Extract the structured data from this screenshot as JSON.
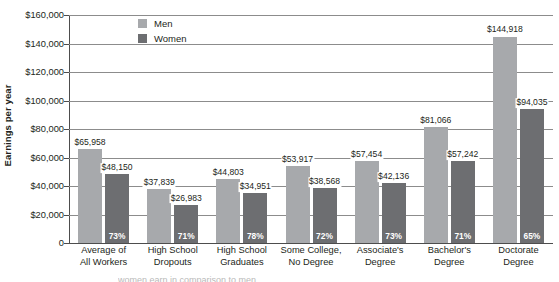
{
  "chart_data": {
    "type": "bar",
    "title": "",
    "xlabel": "",
    "ylabel": "Earnings per year",
    "ylim": [
      0,
      160000
    ],
    "grid": true,
    "legend_position": "top-center",
    "categories": [
      "Average of\nAll Workers",
      "High School\nDropouts",
      "High School\nGraduates",
      "Some College,\nNo Degree",
      "Associate's\nDegree",
      "Bachelor's\nDegree",
      "Doctorate\nDegree"
    ],
    "category_lines": [
      [
        "Average of",
        "All Workers"
      ],
      [
        "High School",
        "Dropouts"
      ],
      [
        "High School",
        "Graduates"
      ],
      [
        "Some College,",
        "No Degree"
      ],
      [
        "Associate's",
        "Degree"
      ],
      [
        "Bachelor's",
        "Degree"
      ],
      [
        "Doctorate",
        "Degree"
      ]
    ],
    "series": [
      {
        "name": "Men",
        "color": "#a7a9ac",
        "values": [
          65958,
          37839,
          44803,
          53917,
          57454,
          81066,
          144918
        ],
        "labels": [
          "$65,958",
          "$37,839",
          "$44,803",
          "$53,917",
          "$57,454",
          "$81,066",
          "$144,918"
        ]
      },
      {
        "name": "Women",
        "color": "#6d6e71",
        "values": [
          48150,
          26983,
          34951,
          38568,
          42136,
          57242,
          94035
        ],
        "labels": [
          "$48,150",
          "$26,983",
          "$34,951",
          "$38,568",
          "$42,136",
          "$57,242",
          "$94,035"
        ],
        "in_bar_labels": [
          "73%",
          "71%",
          "78%",
          "72%",
          "73%",
          "71%",
          "65%"
        ]
      }
    ],
    "y_ticks": [
      0,
      20000,
      40000,
      60000,
      80000,
      100000,
      120000,
      140000,
      160000
    ],
    "y_tick_labels": [
      "0",
      "$20,000",
      "$40,000",
      "$60,000",
      "$80,000",
      "$100,000",
      "$120,000",
      "$140,000",
      "$160,000"
    ]
  },
  "legend": {
    "items": [
      {
        "label": "Men",
        "color": "#a7a9ac"
      },
      {
        "label": "Women",
        "color": "#6d6e71"
      }
    ]
  },
  "axis": {
    "y_title": "Earnings per year"
  },
  "caption": {
    "text": "women earn in comparison to men"
  }
}
